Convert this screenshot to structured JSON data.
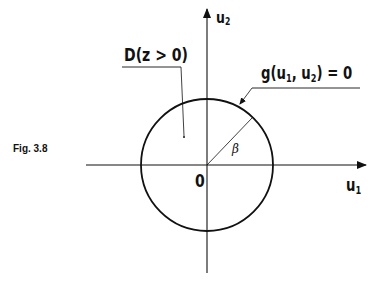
{
  "figure": {
    "caption": "Fig. 3.8",
    "axes": {
      "x_label": "u",
      "x_label_sub": "1",
      "y_label": "u",
      "y_label_sub": "2",
      "origin_label": "0"
    },
    "region_label": "D(z > 0)",
    "boundary_label": {
      "prefix": "g(u",
      "sub1": "1",
      "mid": ", u",
      "sub2": "2",
      "suffix": ") = 0"
    },
    "radius_label": "β",
    "circle": {
      "cx": 207,
      "cy": 165,
      "r": 66
    },
    "stroke_color": "#111111"
  }
}
